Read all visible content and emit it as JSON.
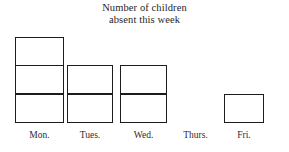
{
  "chart_data": {
    "type": "bar",
    "title": "Number of children absent this week",
    "title_lines": [
      "Number of children",
      "absent this week"
    ],
    "categories": [
      "Mon.",
      "Tues.",
      "Wed.",
      "Thurs.",
      "Fri."
    ],
    "values": [
      3,
      2,
      2,
      0,
      1
    ],
    "xlabel": "",
    "ylabel": "",
    "ylim": [
      0,
      3
    ],
    "unit_cell": 1,
    "grid": false,
    "legend": false,
    "style": {
      "bar_fill": "#ffffff",
      "bar_stroke": "#1c1c1c",
      "background": "#ffffff",
      "text_color": "#262626"
    }
  },
  "bars": [
    {
      "label": "Mon.",
      "value": 3,
      "left": 15,
      "width": 49,
      "label_left": 12,
      "label_width": 55
    },
    {
      "label": "Tues.",
      "value": 2,
      "left": 67,
      "width": 46,
      "label_left": 64,
      "label_width": 52
    },
    {
      "label": "Wed.",
      "value": 2,
      "left": 120,
      "width": 47,
      "label_left": 117,
      "label_width": 53
    },
    {
      "label": "Thurs.",
      "value": 0,
      "left": 172,
      "width": 47,
      "label_left": 168,
      "label_width": 55
    },
    {
      "label": "Fri.",
      "value": 1,
      "left": 224,
      "width": 40,
      "label_left": 219,
      "label_width": 50
    }
  ]
}
